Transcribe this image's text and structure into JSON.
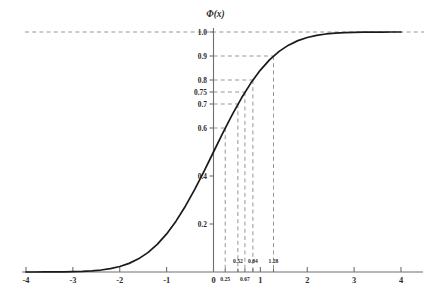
{
  "chart_data": {
    "type": "line",
    "title": "Φ(x)",
    "xlabel": "",
    "ylabel": "",
    "xlim": [
      -4,
      4
    ],
    "ylim": [
      0,
      1.04
    ],
    "grid": false,
    "legend": null,
    "curve_label": "standard normal cumulative distribution function",
    "x_ticks": [
      {
        "value": -4,
        "label": "-4"
      },
      {
        "value": -3,
        "label": "-3"
      },
      {
        "value": -2,
        "label": "-2"
      },
      {
        "value": -1,
        "label": "-1"
      },
      {
        "value": 0,
        "label": "0"
      },
      {
        "value": 1,
        "label": "1"
      },
      {
        "value": 2,
        "label": "2"
      },
      {
        "value": 3,
        "label": "3"
      },
      {
        "value": 4,
        "label": "4"
      }
    ],
    "x_ticks_minor": [
      {
        "value": 0.25,
        "label": "0.25",
        "row": "lower"
      },
      {
        "value": 0.52,
        "label": "0.52",
        "row": "upper"
      },
      {
        "value": 0.67,
        "label": "0.67",
        "row": "lower"
      },
      {
        "value": 0.84,
        "label": "0.84",
        "row": "upper"
      },
      {
        "value": 1.28,
        "label": "1.28",
        "row": "upper"
      }
    ],
    "y_ticks": [
      {
        "value": 0.2,
        "label": "0.2"
      },
      {
        "value": 0.4,
        "label": "0.4"
      },
      {
        "value": 0.6,
        "label": "0.6"
      },
      {
        "value": 0.7,
        "label": "0.7"
      },
      {
        "value": 0.75,
        "label": "0.75"
      },
      {
        "value": 0.8,
        "label": "0.8"
      },
      {
        "value": 0.9,
        "label": "0.9"
      },
      {
        "value": 1.0,
        "label": "1.0"
      }
    ],
    "guide_lines": [
      {
        "x": 0.25,
        "y": 0.6
      },
      {
        "x": 0.52,
        "y": 0.7
      },
      {
        "x": 0.67,
        "y": 0.75
      },
      {
        "x": 0.84,
        "y": 0.8
      },
      {
        "x": 1.28,
        "y": 0.9
      }
    ],
    "asymptote": {
      "y": 1.0,
      "style": "dashed",
      "label": "1.0"
    },
    "series": [
      {
        "name": "Φ(x)",
        "x": [
          -4.0,
          -3.8,
          -3.6,
          -3.4,
          -3.2,
          -3.0,
          -2.8,
          -2.6,
          -2.4,
          -2.2,
          -2.0,
          -1.8,
          -1.6,
          -1.4,
          -1.2,
          -1.0,
          -0.8,
          -0.6,
          -0.4,
          -0.2,
          0.0,
          0.2,
          0.4,
          0.6,
          0.8,
          1.0,
          1.2,
          1.4,
          1.6,
          1.8,
          2.0,
          2.2,
          2.4,
          2.6,
          2.8,
          3.0,
          3.2,
          3.4,
          3.6,
          3.8,
          4.0
        ],
        "y": [
          3e-05,
          7e-05,
          0.00016,
          0.00034,
          0.00069,
          0.00135,
          0.00256,
          0.00466,
          0.0082,
          0.0139,
          0.02275,
          0.03593,
          0.0548,
          0.08076,
          0.11507,
          0.15866,
          0.21186,
          0.27425,
          0.34458,
          0.42074,
          0.5,
          0.57926,
          0.65542,
          0.72575,
          0.78814,
          0.84134,
          0.88493,
          0.91924,
          0.9452,
          0.96407,
          0.97725,
          0.9861,
          0.9918,
          0.99534,
          0.99744,
          0.99865,
          0.99931,
          0.99966,
          0.99984,
          0.99993,
          0.99997
        ]
      }
    ],
    "colors": {
      "curve": "#1a1a1a",
      "axis": "#6e6e6e",
      "dash": "#8a8a8a",
      "text": "#2b2b2b",
      "background": "#ffffff"
    }
  }
}
